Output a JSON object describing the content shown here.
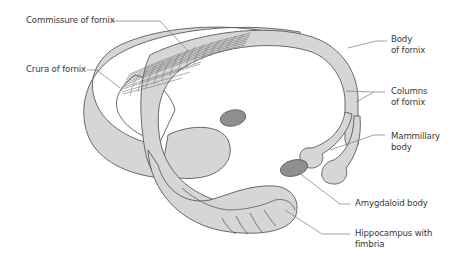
{
  "figure": {
    "colors": {
      "structure_fill": "#d6d6d6",
      "dark_fill": "#8f8f8f",
      "outline": "#5a5a5a",
      "leader_line": "#7a7a7a",
      "text": "#3a3a3a",
      "background": "#ffffff"
    }
  },
  "labels": {
    "commissure": {
      "text": "Commissure of fornix"
    },
    "crura": {
      "text": "Crura of fornix"
    },
    "body": {
      "line1": "Body",
      "line2": "of fornix"
    },
    "columns": {
      "line1": "Columns",
      "line2": "of fornix"
    },
    "mammillary": {
      "line1": "Mammillary",
      "line2": "body"
    },
    "amygdaloid": {
      "text": "Amygdaloid body"
    },
    "hippocampus": {
      "line1": "Hippocampus with",
      "line2": "fimbria"
    }
  }
}
